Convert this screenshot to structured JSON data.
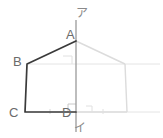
{
  "figure": {
    "vertices": {
      "A": {
        "label": "A",
        "x": 76,
        "y": 41
      },
      "B": {
        "label": "B",
        "x": 27,
        "y": 64
      },
      "C": {
        "label": "C",
        "x": 25,
        "y": 112
      },
      "D": {
        "label": "D",
        "x": 76,
        "y": 112
      }
    },
    "axis": {
      "top_label": "ア",
      "bottom_label": "イ",
      "x": 76,
      "y_top": 20,
      "y_bottom": 132
    },
    "mirrored_vertices": {
      "B2": {
        "x": 125,
        "y": 64
      },
      "C2": {
        "x": 127,
        "y": 112
      }
    },
    "colors": {
      "solid_stroke": "#3a3a3a",
      "axis_stroke": "#9a9a9a",
      "faint_stroke": "#dcdcdc",
      "guide_stroke": "#e6e6e6",
      "label_text": "#6b6b6b",
      "axis_label_text": "#8a8a8a",
      "background": "#ffffff"
    }
  }
}
